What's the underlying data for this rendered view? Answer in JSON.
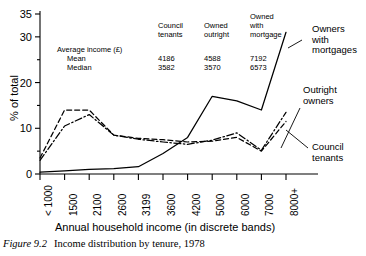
{
  "caption": {
    "figure_number": "Figure 9.2",
    "text": "Income distribution by tenure, 1978"
  },
  "stats_table": {
    "headers": [
      "Council tenants",
      "Owned outright",
      "Owned with mortgage"
    ],
    "headers_split": [
      [
        "Council",
        "tenants"
      ],
      [
        "Owned",
        "outright"
      ],
      [
        "Owned",
        "with",
        "mortgage"
      ]
    ],
    "title": "Average income (£)",
    "rows": [
      {
        "label": "Mean",
        "values": [
          "4186",
          "4588",
          "7192"
        ]
      },
      {
        "label": "Median",
        "values": [
          "3582",
          "3570",
          "6573"
        ]
      }
    ]
  },
  "annotations": [
    {
      "id": "owners-with-mortgages",
      "lines": [
        "Owners",
        "with",
        "mortgages"
      ]
    },
    {
      "id": "outright-owners",
      "lines": [
        "Outright",
        "owners"
      ]
    },
    {
      "id": "council-tenants",
      "lines": [
        "Council",
        "tenants"
      ]
    }
  ],
  "chart_data": {
    "type": "line",
    "title": "Income distribution by tenure, 1978",
    "xlabel": "Annual household income (in discrete bands)",
    "ylabel": "% of total",
    "categories": [
      "< 1000",
      "1500",
      "2100",
      "2600",
      "3199",
      "3600",
      "4200",
      "5000",
      "6000",
      "7000",
      "8000+"
    ],
    "xlim_categories": 11,
    "ylim": [
      0,
      35
    ],
    "yticks": [
      0,
      10,
      20,
      30,
      35
    ],
    "yticks_minor": [
      5,
      15,
      25
    ],
    "grid": false,
    "legend_position": "inline-annotations",
    "series": [
      {
        "name": "Council tenants",
        "style": "dashed",
        "values": [
          3.5,
          14.0,
          14.0,
          8.5,
          7.8,
          7.5,
          7.0,
          7.2,
          8.0,
          5.0,
          11.5
        ]
      },
      {
        "name": "Outright owners",
        "style": "dash-dot",
        "values": [
          3.0,
          10.5,
          13.0,
          8.5,
          7.6,
          7.0,
          6.5,
          7.4,
          9.0,
          5.2,
          13.5
        ]
      },
      {
        "name": "Owners with mortgages",
        "style": "solid",
        "values": [
          0.4,
          0.7,
          1.0,
          1.2,
          1.6,
          4.5,
          8.0,
          17.0,
          16.0,
          14.0,
          31.0
        ]
      }
    ]
  }
}
